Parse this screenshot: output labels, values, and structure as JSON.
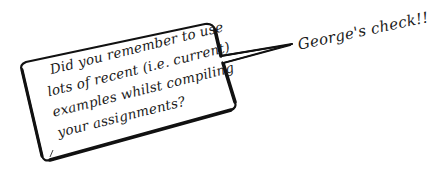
{
  "bubble": {
    "lines": [
      "Did you remember to use",
      "lots of recent (i.e. current)",
      "examples whilst compiling",
      "your assignments?"
    ],
    "border_color": "#111111",
    "fill_color": "#ffffff"
  },
  "caption": {
    "text": "George's check!!"
  },
  "icons": {
    "speech_bubble": "speech-bubble-icon"
  }
}
